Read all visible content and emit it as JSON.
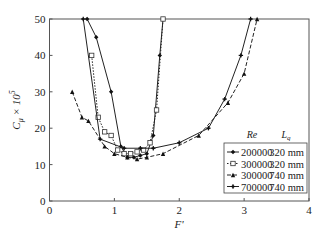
{
  "chart_data": {
    "type": "line",
    "title": "",
    "xlabel": "F'",
    "ylabel": "C_μ × 10^5",
    "xlim": [
      0,
      4
    ],
    "ylim": [
      0,
      50
    ],
    "xticks": [
      0,
      1,
      2,
      3,
      4
    ],
    "yticks": [
      0,
      10,
      20,
      30,
      40,
      50
    ],
    "grid": false,
    "legend_position": "lower right",
    "legend_header": {
      "re": "Re",
      "lq": "L_q"
    },
    "series": [
      {
        "name": "200000 320 mm",
        "re": "200000",
        "lq": "320 mm",
        "marker": "diamond",
        "dash": "solid",
        "x": [
          0.58,
          0.72,
          0.95,
          1.1,
          1.2,
          1.3,
          1.4,
          1.5,
          1.6,
          1.7,
          1.75
        ],
        "y": [
          50,
          45,
          30,
          15,
          12,
          12,
          12.5,
          13,
          18,
          40,
          50
        ]
      },
      {
        "name": "300000 320 mm",
        "re": "300000",
        "lq": "320 mm",
        "marker": "square",
        "dash": "dotted",
        "x": [
          0.65,
          0.75,
          0.85,
          0.95,
          1.05,
          1.15,
          1.25,
          1.35,
          1.45,
          1.55,
          1.65,
          1.75
        ],
        "y": [
          40,
          23,
          19,
          18,
          14,
          13,
          13,
          13.5,
          14,
          16,
          25,
          50
        ]
      },
      {
        "name": "300000 740 mm",
        "re": "300000",
        "lq": "740 mm",
        "marker": "triangle",
        "dash": "dashed",
        "x": [
          0.35,
          0.5,
          0.6,
          0.85,
          1.0,
          1.2,
          1.35,
          1.5,
          1.75,
          2.3,
          2.75,
          3.0,
          3.2
        ],
        "y": [
          30,
          23,
          22,
          15,
          13,
          12,
          11.5,
          12,
          13,
          18,
          27,
          35,
          50
        ]
      },
      {
        "name": "700000 740 mm",
        "re": "700000",
        "lq": "740 mm",
        "marker": "star",
        "dash": "solid",
        "x": [
          0.52,
          0.78,
          1.15,
          1.4,
          1.6,
          2.0,
          2.45,
          2.7,
          2.95,
          3.1
        ],
        "y": [
          50,
          17,
          14.5,
          14.5,
          14.5,
          16,
          20,
          28,
          40,
          50
        ]
      }
    ]
  }
}
